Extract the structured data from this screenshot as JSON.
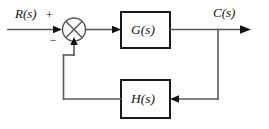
{
  "diagram": {
    "colors": {
      "background": "#ffffff",
      "block_border": "#1a1a1a",
      "wire": "#5a5a5a",
      "arrow": "#111111",
      "text": "#111111"
    },
    "signals": {
      "input_label": "R(s)",
      "output_label": "C(s)"
    },
    "blocks": [
      {
        "id": "forward",
        "label": "G(s)"
      },
      {
        "id": "feedback",
        "label": "H(s)"
      }
    ],
    "summing_junction": {
      "name": "summing-junction",
      "glyph": "circle-with-x",
      "input_sign": "+",
      "feedback_sign": "−"
    }
  }
}
